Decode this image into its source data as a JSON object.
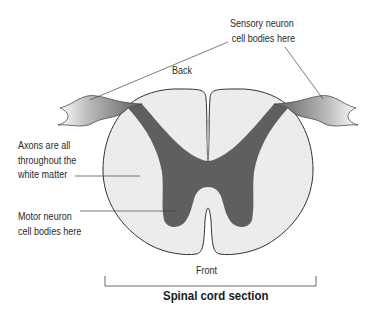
{
  "diagram": {
    "title": "Spinal cord section",
    "labels": {
      "sensory": [
        "Sensory neuron",
        "cell bodies here"
      ],
      "back": "Back",
      "axons": [
        "Axons are all",
        "throughout the",
        "white matter"
      ],
      "motor": [
        "Motor neuron",
        "cell bodies here"
      ],
      "front": "Front"
    },
    "colors": {
      "gray_matter": "#5f5f5f",
      "white_matter": "#ededed",
      "outline": "#333333",
      "leader_line": "#444444"
    }
  }
}
